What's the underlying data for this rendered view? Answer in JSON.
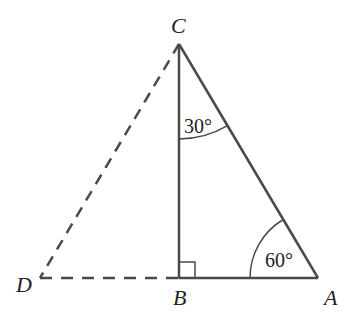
{
  "diagram": {
    "points": {
      "C": {
        "label": "C",
        "x": 179,
        "y": 44
      },
      "B": {
        "label": "B",
        "x": 179,
        "y": 278
      },
      "A": {
        "label": "A",
        "x": 318,
        "y": 278
      },
      "D": {
        "label": "D",
        "x": 40,
        "y": 278
      }
    },
    "angles": {
      "at_C": {
        "label": "30°"
      },
      "at_A": {
        "label": "60°"
      },
      "at_B": {
        "label": "right angle"
      }
    },
    "segments": {
      "solid": [
        "CB",
        "BA",
        "CA"
      ],
      "dashed": [
        "CD",
        "DB"
      ]
    },
    "colors": {
      "line": "#4a4a4a",
      "text": "#222222"
    }
  }
}
